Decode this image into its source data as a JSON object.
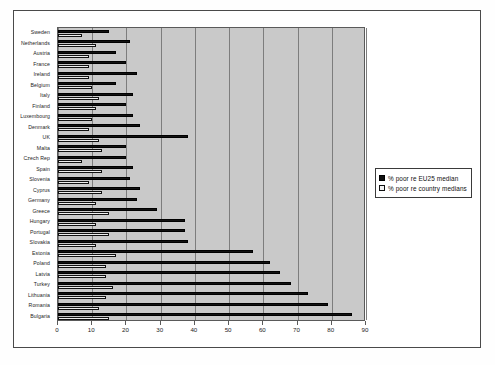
{
  "figure": {
    "background_color": "#ffffff",
    "frame_color": "#4a4a4a",
    "plot_background_color": "#c9c9c9"
  },
  "legend": {
    "position": "right",
    "entries": [
      {
        "label": "% poor re EU25 median",
        "color": "#111111",
        "swatch": "filled-black-square"
      },
      {
        "label": "% poor re country medians",
        "color": "#efefef",
        "swatch": "open-white-square"
      }
    ]
  },
  "axis": {
    "x_ticks": [
      "0",
      "10",
      "20",
      "30",
      "40",
      "50",
      "60",
      "70",
      "80",
      "90"
    ]
  },
  "chart_data": {
    "type": "bar",
    "orientation": "horizontal",
    "title": "",
    "subtitle": "",
    "xlabel": "",
    "ylabel": "",
    "xlim": [
      0,
      90
    ],
    "ylim": [
      0,
      27
    ],
    "grid": true,
    "grid_axis": "x",
    "legend_position": "right",
    "tick_step": 10,
    "categories": [
      "Sweden",
      "Netherlands",
      "Austria",
      "France",
      "Ireland",
      "Belgium",
      "Italy",
      "Finland",
      "Luxembourg",
      "Denmark",
      "UK",
      "Malta",
      "Czech Rep",
      "Spain",
      "Slovenia",
      "Cyprus",
      "Germany",
      "Greece",
      "Hungary",
      "Portugal",
      "Slovakia",
      "Estonia",
      "Poland",
      "Latvia",
      "Turkey",
      "Lithuania",
      "Romania",
      "Bulgaria"
    ],
    "series": [
      {
        "name": "% poor re EU25 median",
        "color": "#111111",
        "values": [
          15,
          21,
          17,
          20,
          23,
          17,
          22,
          20,
          22,
          24,
          38,
          20,
          20,
          22,
          21,
          24,
          23,
          29,
          37,
          37,
          38,
          57,
          62,
          65,
          68,
          73,
          79,
          86
        ]
      },
      {
        "name": "% poor re country medians",
        "color": "#efefef",
        "values": [
          7,
          11,
          9,
          9,
          9,
          10,
          12,
          11,
          10,
          9,
          12,
          13,
          7,
          13,
          9,
          13,
          11,
          15,
          11,
          15,
          11,
          17,
          14,
          14,
          16,
          14,
          12,
          15
        ]
      }
    ]
  }
}
